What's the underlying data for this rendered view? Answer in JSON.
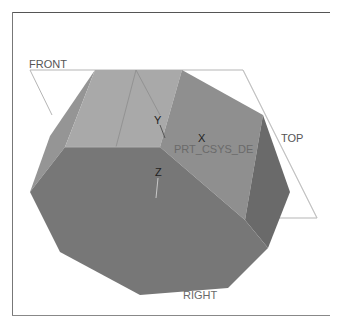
{
  "viewport": {
    "background": "#ffffff",
    "frame_color": "#666666"
  },
  "datum_planes": {
    "front": {
      "label": "FRONT"
    },
    "top": {
      "label": "TOP"
    },
    "right": {
      "label": "RIGHT"
    }
  },
  "csys": {
    "name": "PRT_CSYS_DEF",
    "name_visible": "PRT_CSYS_DE",
    "axes": {
      "x": "X",
      "y": "Y",
      "z": "Z"
    }
  },
  "model": {
    "faces": {
      "top_left": "#a9a9a9",
      "top_middle": "#8f8f8f",
      "right": "#6e6e6e",
      "front": "#777777",
      "left": "#959595"
    }
  }
}
